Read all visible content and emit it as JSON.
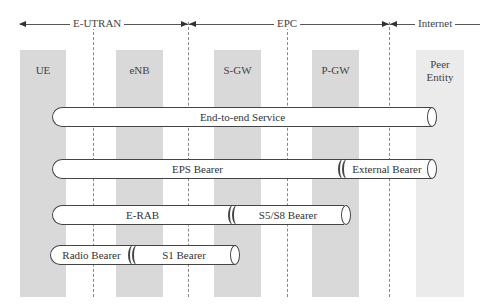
{
  "domains": [
    {
      "label": "E-UTRAN"
    },
    {
      "label": "EPC"
    },
    {
      "label": "Internet"
    }
  ],
  "nodes": [
    {
      "label": "UE"
    },
    {
      "label": "eNB"
    },
    {
      "label": "S-GW"
    },
    {
      "label": "P-GW"
    },
    {
      "label": "Peer Entity"
    }
  ],
  "bearers": {
    "end_to_end": "End-to-end Service",
    "eps": "EPS Bearer",
    "external": "External Bearer",
    "erab": "E-RAB",
    "s5s8": "S5/S8 Bearer",
    "radio": "Radio Bearer",
    "s1": "S1 Bearer"
  },
  "colors": {
    "node_fill": "#d9d9d9",
    "peer_fill": "#ebebeb",
    "line": "#444444"
  }
}
